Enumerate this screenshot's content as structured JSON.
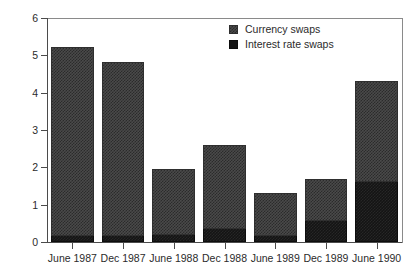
{
  "chart_data": {
    "type": "bar",
    "stacked": true,
    "title": "",
    "subtitle": "",
    "xlabel": "",
    "ylabel": "NZ$bn",
    "ylim": [
      0,
      6
    ],
    "yticks": [
      0,
      1,
      2,
      3,
      4,
      5,
      6
    ],
    "ytick_labels": [
      "0",
      "1",
      "2",
      "3",
      "4",
      "5",
      "6"
    ],
    "grid": false,
    "legend_position": "top-right",
    "categories": [
      "June 1987",
      "Dec 1987",
      "June 1988",
      "Dec 1988",
      "June 1989",
      "Dec 1989",
      "June 1990"
    ],
    "series": [
      {
        "name": "Currency swaps",
        "color": "#4a4a4a",
        "values": [
          5.05,
          4.65,
          1.75,
          2.25,
          1.15,
          1.15,
          2.7
        ]
      },
      {
        "name": "Interest rate swaps",
        "color": "#141414",
        "values": [
          0.17,
          0.17,
          0.2,
          0.35,
          0.15,
          0.55,
          1.6
        ]
      }
    ],
    "totals": [
      5.22,
      4.82,
      1.95,
      2.6,
      1.3,
      1.7,
      4.3
    ]
  },
  "legend": {
    "items": [
      {
        "label": "Currency swaps",
        "swatch": "currency-swatch-icon"
      },
      {
        "label": "Interest rate swaps",
        "swatch": "interest-swatch-icon"
      }
    ]
  },
  "colors": {
    "currency_swaps": "#4a4a4a",
    "interest_rate_swaps": "#141414",
    "axis": "#4b4b4b",
    "text": "#2b2b2b",
    "background": "#ffffff"
  }
}
